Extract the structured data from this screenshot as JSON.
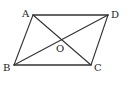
{
  "diagram": {
    "title": "",
    "shape": "parallelogram",
    "vertices": {
      "A": {
        "label": "A",
        "x": 33,
        "y": 15
      },
      "D": {
        "label": "D",
        "x": 108,
        "y": 15
      },
      "B": {
        "label": "B",
        "x": 14,
        "y": 65
      },
      "C": {
        "label": "C",
        "x": 91,
        "y": 65
      }
    },
    "center": {
      "label": "O",
      "x": 60,
      "y": 41
    },
    "edges": [
      "AD",
      "DC",
      "CB",
      "BA"
    ],
    "diagonals": [
      "AC",
      "BD"
    ],
    "colors": {
      "stroke": "#333333",
      "label": "#222222",
      "background": "#ffffff"
    }
  }
}
